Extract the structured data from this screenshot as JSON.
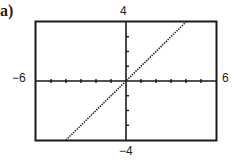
{
  "panel_label": "a)",
  "chart_data": {
    "type": "line",
    "title": "",
    "xlabel": "",
    "ylabel": "",
    "xlim": [
      -6,
      6
    ],
    "ylim": [
      -4,
      4
    ],
    "x_tick_labels": {
      "min": "−6",
      "max": "6"
    },
    "y_tick_labels": {
      "min": "−4",
      "max": "4"
    },
    "x_tick_step": 1,
    "y_tick_step": 1,
    "grid": false,
    "series": [
      {
        "name": "y = x",
        "style": "dotted",
        "x": [
          -4,
          4
        ],
        "y": [
          -4,
          4
        ]
      }
    ]
  }
}
